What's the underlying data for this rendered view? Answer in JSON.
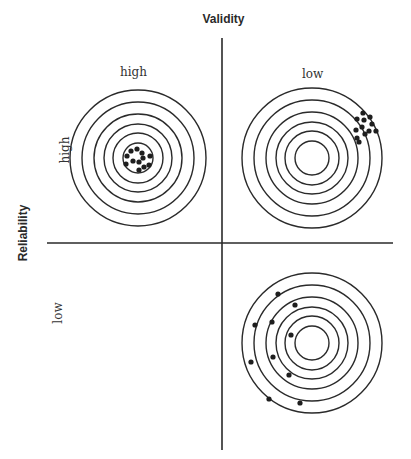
{
  "chart_data": {
    "type": "scatter",
    "xlabel": "Validity",
    "ylabel": "Reliability",
    "column_labels": [
      "high",
      "low"
    ],
    "row_labels": [
      "high",
      "low"
    ],
    "grid": false,
    "legend": null,
    "axes": {
      "vertical": {
        "x": 222,
        "y1": 38,
        "y2": 450
      },
      "horizontal": {
        "y": 243,
        "x1": 47,
        "x2": 393
      }
    },
    "panels": [
      {
        "id": "high-reliability-high-validity",
        "reliability": "high",
        "validity": "high",
        "center": [
          138,
          158
        ],
        "ring_radii": [
          68,
          56,
          44,
          34,
          25,
          15
        ],
        "dots": [
          [
            131,
            151
          ],
          [
            137,
            149
          ],
          [
            142,
            153
          ],
          [
            127,
            156
          ],
          [
            143,
            158
          ],
          [
            150,
            156
          ],
          [
            133,
            161
          ],
          [
            139,
            162
          ],
          [
            126,
            164
          ],
          [
            144,
            167
          ],
          [
            139,
            170
          ],
          [
            149,
            165
          ]
        ]
      },
      {
        "id": "high-reliability-low-validity",
        "reliability": "high",
        "validity": "low",
        "center": [
          312,
          158
        ],
        "ring_radii": [
          70,
          58,
          46,
          36,
          27,
          17
        ],
        "dots": [
          [
            363,
            113
          ],
          [
            357,
            119
          ],
          [
            364,
            120
          ],
          [
            370,
            117
          ],
          [
            372,
            124
          ],
          [
            356,
            130
          ],
          [
            362,
            127
          ],
          [
            369,
            131
          ],
          [
            376,
            131
          ],
          [
            357,
            138
          ],
          [
            365,
            134
          ],
          [
            359,
            142
          ]
        ]
      },
      {
        "id": "low-reliability-low-validity",
        "reliability": "low",
        "validity": "low",
        "center": [
          312,
          343
        ],
        "ring_radii": [
          70,
          58,
          46,
          36,
          27,
          17
        ],
        "dots": [
          [
            278,
            294
          ],
          [
            295,
            305
          ],
          [
            255,
            325
          ],
          [
            272,
            322
          ],
          [
            291,
            335
          ],
          [
            251,
            362
          ],
          [
            273,
            357
          ],
          [
            289,
            375
          ],
          [
            269,
            399
          ],
          [
            300,
            403
          ]
        ]
      }
    ],
    "empty_panel": "low-reliability-high-validity"
  },
  "labels": {
    "validity_title": "Validity",
    "reliability_title": "Reliability",
    "validity_high": "high",
    "validity_low": "low",
    "reliability_high": "high",
    "reliability_low": "low"
  },
  "colors": {
    "line": "#2a2a2a",
    "dot": "#1e1e1e",
    "background": "#ffffff"
  }
}
